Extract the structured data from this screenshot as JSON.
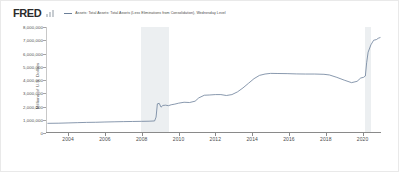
{
  "header": {
    "logo_text": "FRED",
    "logo_mark_name": "fred-bar-mark",
    "legend_label": "Assets: Total Assets: Total Assets (Less Eliminations from Consolidation), Wednesday Level"
  },
  "colors": {
    "line": "#6b7f99",
    "recession_band": "#eceff1",
    "axis": "#8a8a8a",
    "text": "#4d4d4d",
    "background": "#ffffff",
    "border": "#e9e9e9"
  },
  "chart_data": {
    "type": "line",
    "title": "",
    "subtitle": "",
    "xlabel": "",
    "ylabel": "Millions of U.S. Dollars",
    "legend": [
      "Assets: Total Assets: Total Assets (Less Eliminations from Consolidation), Wednesday Level"
    ],
    "legend_position": "top",
    "grid": false,
    "xlim": [
      2002.8,
      2021.0
    ],
    "ylim": [
      0,
      8000000
    ],
    "xticks": [
      2004,
      2006,
      2008,
      2010,
      2012,
      2014,
      2016,
      2018,
      2020
    ],
    "xtick_labels": [
      "2004",
      "2006",
      "2008",
      "2010",
      "2012",
      "2014",
      "2016",
      "2018",
      "2020"
    ],
    "yticks": [
      0,
      1000000,
      2000000,
      3000000,
      4000000,
      5000000,
      6000000,
      7000000,
      8000000
    ],
    "ytick_labels": [
      "0",
      "1,000,000",
      "2,000,000",
      "3,000,000",
      "4,000,000",
      "5,000,000",
      "6,000,000",
      "7,000,000",
      "8,000,000"
    ],
    "shaded_regions": [
      {
        "name": "recession-2008",
        "x0": 2007.95,
        "x1": 2009.5
      },
      {
        "name": "recession-2020",
        "x0": 2020.12,
        "x1": 2020.45
      }
    ],
    "series": [
      {
        "name": "Assets: Total Assets: Total Assets (Less Eliminations from Consolidation), Wednesday Level",
        "x": [
          2002.9,
          2003.5,
          2004.0,
          2004.5,
          2005.0,
          2005.5,
          2006.0,
          2006.5,
          2007.0,
          2007.5,
          2008.0,
          2008.4,
          2008.7,
          2008.78,
          2008.85,
          2008.95,
          2009.05,
          2009.15,
          2009.3,
          2009.45,
          2009.6,
          2009.8,
          2010.0,
          2010.3,
          2010.6,
          2010.9,
          2011.1,
          2011.4,
          2011.7,
          2012.0,
          2012.3,
          2012.6,
          2012.9,
          2013.2,
          2013.5,
          2013.8,
          2014.1,
          2014.4,
          2014.7,
          2015.0,
          2015.4,
          2015.9,
          2016.4,
          2016.9,
          2017.4,
          2017.9,
          2018.2,
          2018.6,
          2019.0,
          2019.4,
          2019.7,
          2019.9,
          2020.05,
          2020.15,
          2020.22,
          2020.3,
          2020.45,
          2020.6,
          2020.75,
          2020.85,
          2020.95
        ],
        "y": [
          730000,
          740000,
          760000,
          780000,
          800000,
          810000,
          830000,
          845000,
          860000,
          870000,
          880000,
          890000,
          910000,
          1200000,
          2200000,
          2240000,
          1950000,
          2080000,
          2100000,
          2060000,
          2130000,
          2180000,
          2250000,
          2320000,
          2300000,
          2400000,
          2650000,
          2850000,
          2870000,
          2900000,
          2900000,
          2830000,
          2900000,
          3100000,
          3400000,
          3750000,
          4100000,
          4350000,
          4450000,
          4500000,
          4490000,
          4480000,
          4460000,
          4450000,
          4450000,
          4430000,
          4380000,
          4200000,
          3990000,
          3800000,
          3900000,
          4150000,
          4200000,
          4300000,
          5300000,
          6100000,
          6650000,
          7000000,
          7050000,
          7150000,
          7200000
        ]
      }
    ]
  }
}
